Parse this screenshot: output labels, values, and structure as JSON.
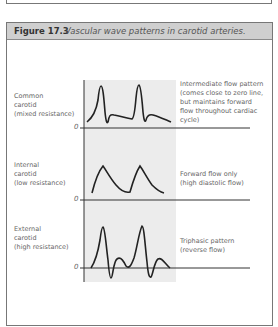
{
  "figure": {
    "number": "Figure 17.3",
    "title": "Vascular wave patterns in carotid arteries."
  },
  "rows": [
    {
      "vessel_label": "Common\ncarotid\n(mixed resistance)",
      "zero_label": "0",
      "description": "Intermediate flow pattern\n(comes close to zero line,\nbut maintains forward\nflow throughout cardiac\ncycle)"
    },
    {
      "vessel_label": "Internal\ncarotid\n(low resistance)",
      "zero_label": "0",
      "description": "Forward flow only\n(high diastolic flow)"
    },
    {
      "vessel_label": "External\ncarotid\n(high resistance)",
      "zero_label": "0",
      "description": "Triphasic pattern\n(reverse flow)"
    }
  ],
  "colors": {
    "header_bg": "#cfcfcf",
    "panel_bg": "#ececec",
    "line": "#222222",
    "text": "#666666"
  }
}
